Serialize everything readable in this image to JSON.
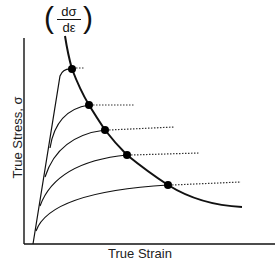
{
  "diagram": {
    "title_expression": {
      "numerator": "dσ",
      "denominator": "dε",
      "left_paren": "(",
      "right_paren": ")"
    },
    "y_axis_label": "True Stress, σ",
    "x_axis_label": "True Strain",
    "colors": {
      "line": "#111111",
      "dotted": "#333333",
      "marker": "#000000"
    },
    "strain_hardening_curve_points": [
      [
        70,
        5
      ],
      [
        72,
        69
      ],
      [
        89,
        105
      ],
      [
        105,
        130
      ],
      [
        127,
        155
      ],
      [
        168,
        185
      ],
      [
        200,
        200
      ],
      [
        240,
        207
      ]
    ],
    "intersection_points": [
      {
        "x": 72,
        "y": 69
      },
      {
        "x": 89,
        "y": 105
      },
      {
        "x": 105,
        "y": 130
      },
      {
        "x": 127,
        "y": 155
      },
      {
        "x": 168,
        "y": 185
      }
    ]
  }
}
